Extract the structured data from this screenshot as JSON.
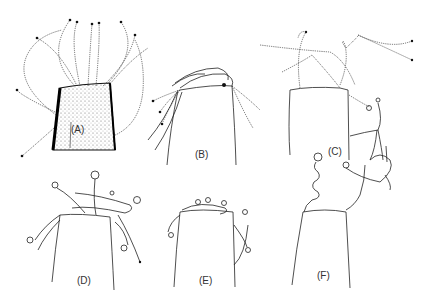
{
  "figure": {
    "panels": [
      {
        "id": "A",
        "label": "(A)"
      },
      {
        "id": "B",
        "label": "(B)"
      },
      {
        "id": "C",
        "label": "(C)"
      },
      {
        "id": "D",
        "label": "(D)"
      },
      {
        "id": "E",
        "label": "(E)"
      },
      {
        "id": "F",
        "label": "(F)"
      }
    ]
  }
}
